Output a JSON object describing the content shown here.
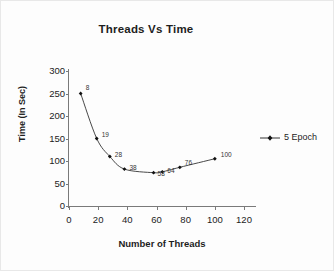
{
  "chart_data": {
    "type": "line",
    "title": "Threads Vs Time",
    "xlabel": "Number of Threads",
    "ylabel": "Time (In Sec)",
    "xlim": [
      0,
      120
    ],
    "ylim": [
      0,
      300
    ],
    "xticks": [
      0,
      20,
      40,
      60,
      80,
      100,
      120
    ],
    "yticks": [
      0,
      50,
      100,
      150,
      200,
      250,
      300
    ],
    "grid": false,
    "legend_position": "right",
    "marker": "diamond",
    "line_color": "#333333",
    "series": [
      {
        "name": "5 Epoch",
        "x": [
          8,
          19,
          28,
          38,
          58,
          64,
          76,
          100
        ],
        "values": [
          250,
          150,
          110,
          82,
          74,
          76,
          86,
          105
        ],
        "point_labels": [
          "8",
          "19",
          "28",
          "38",
          "58",
          "64",
          "76",
          "100"
        ]
      }
    ]
  },
  "legend": {
    "entries": [
      {
        "label": "5 Epoch"
      }
    ]
  }
}
